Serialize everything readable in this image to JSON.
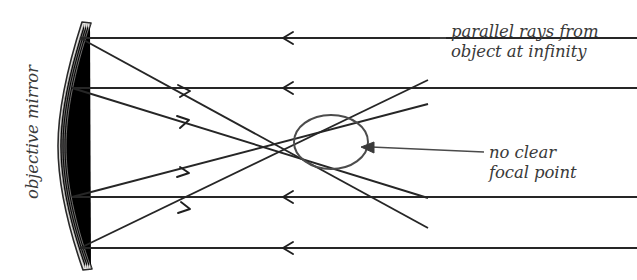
{
  "figure": {
    "type": "optics-ray-diagram",
    "background_color": "#ffffff"
  },
  "labels": {
    "objective_mirror": "objective mirror",
    "parallel_rays_line1": "parallel rays from",
    "parallel_rays_line2": "object at infinity",
    "no_clear_focal_line1": "no clear",
    "no_clear_focal_line2": "focal point"
  },
  "colors": {
    "ray": "#262626",
    "mirror_fill": "#e4e3e1",
    "mirror_stroke": "#2a2a2a",
    "circle_stroke": "#4c4c4c",
    "text": "#3a3a3a",
    "leader": "#4a4a4a"
  },
  "mirror": {
    "name": "objective mirror",
    "top_y": 22,
    "bottom_y": 270,
    "vertex_x": 58,
    "edge_x": 82,
    "thickness": 9
  },
  "caustic_region": {
    "name": "no clear focal point",
    "center_x": 331,
    "center_y": 142,
    "radius_x": 37,
    "radius_y": 27
  },
  "incoming_rays": [
    {
      "id": "ray-1",
      "y": 38,
      "start_x": 637,
      "end_x": 80,
      "arrow_x": 285,
      "direction": "left"
    },
    {
      "id": "ray-2",
      "y": 88,
      "start_x": 637,
      "end_x": 72,
      "arrow_x": 285,
      "direction": "left"
    },
    {
      "id": "ray-3",
      "y": 197,
      "start_x": 637,
      "end_x": 72,
      "arrow_x": 285,
      "direction": "left"
    },
    {
      "id": "ray-4",
      "y": 248,
      "start_x": 637,
      "end_x": 80,
      "arrow_x": 285,
      "direction": "left"
    }
  ],
  "reflected_rays": [
    {
      "id": "reflect-1",
      "from_x": 80,
      "from_y": 38,
      "to_x": 428,
      "to_y": 228,
      "arrow_at": 0.3
    },
    {
      "id": "reflect-2",
      "from_x": 72,
      "from_y": 88,
      "to_x": 428,
      "to_y": 198,
      "arrow_at": 0.3
    },
    {
      "id": "reflect-3",
      "from_x": 72,
      "from_y": 197,
      "to_x": 428,
      "to_y": 104,
      "arrow_at": 0.3
    },
    {
      "id": "reflect-4",
      "from_x": 80,
      "from_y": 248,
      "to_x": 428,
      "to_y": 80,
      "arrow_at": 0.3
    }
  ],
  "leader": {
    "arrow_tip_x": 362,
    "arrow_tip_y": 147,
    "line_end_x": 484,
    "line_end_y": 152
  }
}
